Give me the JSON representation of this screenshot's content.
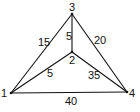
{
  "diagram": {
    "type": "weighted-undirected-graph",
    "nodes": [
      {
        "id": "1",
        "label": "1",
        "x": 11,
        "y": 93
      },
      {
        "id": "2",
        "label": "2",
        "x": 72,
        "y": 52
      },
      {
        "id": "3",
        "label": "3",
        "x": 72,
        "y": 14
      },
      {
        "id": "4",
        "label": "4",
        "x": 127,
        "y": 92
      }
    ],
    "edges": [
      {
        "from": "1",
        "to": "3",
        "weight": "15"
      },
      {
        "from": "3",
        "to": "2",
        "weight": "5"
      },
      {
        "from": "3",
        "to": "4",
        "weight": "20"
      },
      {
        "from": "1",
        "to": "2",
        "weight": "5"
      },
      {
        "from": "2",
        "to": "4",
        "weight": "35"
      },
      {
        "from": "1",
        "to": "4",
        "weight": "40"
      }
    ]
  }
}
